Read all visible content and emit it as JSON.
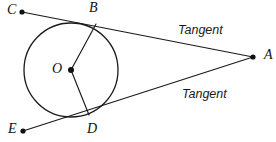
{
  "figure": {
    "kind": "circle-two-tangents-geometry-diagram",
    "background_color": "#ffffff",
    "stroke_color": "#1a1a1a",
    "width": 276,
    "height": 142
  },
  "circle": {
    "center_label": "O",
    "center_x": 71,
    "center_y": 70,
    "radius": 47
  },
  "points": [
    {
      "label": "C",
      "x": 22,
      "y": 12,
      "label_x": 7,
      "label_y": 11,
      "has_dot": true
    },
    {
      "label": "B",
      "x": 96,
      "y": 24,
      "label_x": 89,
      "label_y": 9,
      "has_dot": false
    },
    {
      "label": "A",
      "x": 253,
      "y": 57,
      "label_x": 264,
      "label_y": 56,
      "has_dot": true
    },
    {
      "label": "O",
      "x": 71,
      "y": 70,
      "label_x": 57,
      "label_y": 70,
      "has_dot": true
    },
    {
      "label": "D",
      "x": 89,
      "y": 115,
      "label_x": 92,
      "label_y": 130,
      "has_dot": false
    },
    {
      "label": "E",
      "x": 23,
      "y": 131,
      "label_x": 8,
      "label_y": 130,
      "has_dot": true
    }
  ],
  "segments": [
    {
      "name": "tangent-line-upper",
      "from": "C",
      "to": "A",
      "x1": 22,
      "y1": 12,
      "x2": 253,
      "y2": 57
    },
    {
      "name": "tangent-line-lower",
      "from": "E",
      "to": "A",
      "x1": 23,
      "y1": 131,
      "x2": 253,
      "y2": 57
    },
    {
      "name": "radius-ob",
      "from": "O",
      "to": "B",
      "x1": 71,
      "y1": 70,
      "x2": 96,
      "y2": 24
    },
    {
      "name": "radius-od",
      "from": "O",
      "to": "D",
      "x1": 71,
      "y1": 70,
      "x2": 89,
      "y2": 115
    }
  ],
  "annotations": [
    {
      "name": "tangent-label-upper",
      "text": "Tangent",
      "x": 178,
      "y": 31
    },
    {
      "name": "tangent-label-lower",
      "text": "Tangent",
      "x": 182,
      "y": 95
    }
  ]
}
